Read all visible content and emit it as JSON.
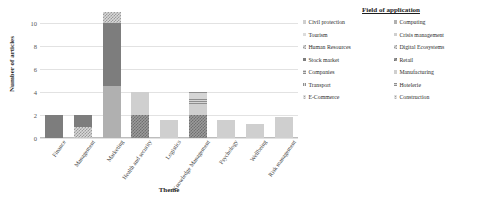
{
  "chart_data": {
    "type": "bar",
    "stacked": true,
    "title": "",
    "xlabel": "Theme",
    "ylabel": "Number of articles",
    "ylim": [
      0,
      11
    ],
    "yticks": [
      0,
      2,
      4,
      6,
      8,
      10
    ],
    "grid": true,
    "legend_title": "Field of application",
    "legend_position": "right",
    "categories": [
      "Finance",
      "Management",
      "Marketing",
      "Health and security",
      "Logistics",
      "Knowledge Management",
      "Psychology",
      "Wellbeing",
      "Risk management"
    ],
    "series": [
      {
        "name": "Civil protection",
        "pattern": "solid-light",
        "color": "#cfcfcf",
        "values": [
          0,
          0,
          0,
          0,
          0,
          0,
          0,
          0,
          0
        ]
      },
      {
        "name": "Tourism",
        "pattern": "solid-pale",
        "color": "#dcdcdc",
        "values": [
          0,
          0,
          0,
          0,
          0,
          0,
          0,
          0,
          0
        ]
      },
      {
        "name": "Human Resources",
        "pattern": "checker",
        "color": "#d8d8d8",
        "values": [
          0,
          1,
          0,
          0,
          0,
          0,
          0,
          0,
          0
        ]
      },
      {
        "name": "Stock market",
        "pattern": "solid-dark",
        "color": "#7d7d7d",
        "values": [
          2,
          1,
          0,
          0,
          0,
          0,
          0,
          0,
          0
        ]
      },
      {
        "name": "Companies",
        "pattern": "hlines",
        "color": "#d5d5d5",
        "values": [
          0,
          0,
          0,
          0,
          0,
          0,
          0,
          0,
          0
        ]
      },
      {
        "name": "Transport",
        "pattern": "vlines",
        "color": "#d9d9d9",
        "values": [
          0,
          0,
          0,
          0,
          0,
          0,
          0,
          0,
          0
        ]
      },
      {
        "name": "E-Commerce",
        "pattern": "dots",
        "color": "#e0e0e0",
        "values": [
          0,
          0,
          0,
          0,
          0,
          0,
          0,
          0,
          0
        ]
      },
      {
        "name": "Computing",
        "pattern": "solid-mid",
        "color": "#b0b0b0",
        "values": [
          0,
          0,
          4.5,
          0,
          0,
          0,
          0,
          0,
          0
        ]
      },
      {
        "name": "Crisis management",
        "pattern": "solid-dark",
        "color": "#7d7d7d",
        "values": [
          0,
          0,
          5.5,
          0,
          0,
          0,
          0,
          0,
          0
        ]
      },
      {
        "name": "Digital Ecosystems",
        "pattern": "checker",
        "color": "#d8d8d8",
        "values": [
          0,
          0,
          1,
          0,
          0,
          0,
          0,
          0,
          0
        ]
      },
      {
        "name": "Retail",
        "pattern": "checker-dark",
        "color": "#9b9b9b",
        "values": [
          0,
          0,
          0,
          2,
          0,
          2,
          0,
          0,
          0
        ]
      },
      {
        "name": "Manufacturing",
        "pattern": "solid-light",
        "color": "#cfcfcf",
        "values": [
          0,
          0,
          0,
          2,
          1.6,
          1,
          1.6,
          1.2,
          1.8
        ]
      },
      {
        "name": "Hotelerie",
        "pattern": "hlines",
        "color": "#d5d5d5",
        "values": [
          0,
          0,
          0,
          0,
          0,
          1,
          0,
          0,
          0
        ]
      },
      {
        "name": "Construction",
        "pattern": "dots",
        "color": "#e0e0e0",
        "values": [
          0,
          0,
          0,
          0,
          0,
          0,
          0,
          0,
          0
        ]
      }
    ],
    "bar_totals": [
      2,
      2,
      11,
      4,
      1.6,
      4,
      1.6,
      1.2,
      1.8
    ]
  },
  "legend": {
    "title": "Field of application",
    "left_column": [
      {
        "label": "Civil protection",
        "pattern": "solid-light"
      },
      {
        "label": "Tourism",
        "pattern": "solid-pale"
      },
      {
        "label": "Human Resources",
        "pattern": "checker"
      },
      {
        "label": "Stock market",
        "pattern": "solid-dark"
      },
      {
        "label": "Companies",
        "pattern": "hlines"
      },
      {
        "label": "Transport",
        "pattern": "vlines"
      },
      {
        "label": "E-Commerce",
        "pattern": "dots"
      }
    ],
    "right_column": [
      {
        "label": "Computing",
        "pattern": "solid-mid"
      },
      {
        "label": "Crisis management",
        "pattern": "solid-light"
      },
      {
        "label": "Digital Ecosystems",
        "pattern": "checker"
      },
      {
        "label": "Retail",
        "pattern": "checker-dark"
      },
      {
        "label": "Manufacturing",
        "pattern": "solid-light"
      },
      {
        "label": "Hotelerie",
        "pattern": "hlines"
      },
      {
        "label": "Construction",
        "pattern": "dots"
      }
    ]
  }
}
